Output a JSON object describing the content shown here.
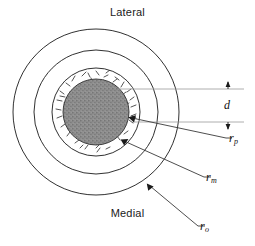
{
  "figure": {
    "title_top": "Lateral",
    "title_bottom": "Medial",
    "background_color": "#ffffff",
    "line_color": "#1a1a1a",
    "leader_color": "#3a3a3a",
    "extension_line_color": "#9a9a9a",
    "core_fill_color": "#8a8a8a",
    "ring_fill_color": "#ffffff",
    "outer_fill_color": "#ffffff"
  },
  "labels": {
    "lateral": "Lateral",
    "medial": "Medial",
    "thickness": {
      "symbol": "d",
      "sub": ""
    },
    "r_p": {
      "symbol": "r",
      "sub": "p"
    },
    "r_m": {
      "symbol": "r",
      "sub": "m"
    },
    "r_o": {
      "symbol": "r",
      "sub": "o"
    }
  },
  "geometry": {
    "center_x": 96,
    "center_y": 112,
    "r_outer": 83,
    "r_outer_inner": 62,
    "r_m": 44,
    "r_p": 33,
    "d_top_y": 89,
    "d_bottom_y": 122
  },
  "icons": {
    "arrow_rp": "arrowhead-icon",
    "arrow_rm": "arrowhead-icon",
    "arrow_ro": "arrowhead-icon",
    "dim_arrow_up": "dimension-arrow-up-icon",
    "dim_arrow_down": "dimension-arrow-down-icon"
  }
}
